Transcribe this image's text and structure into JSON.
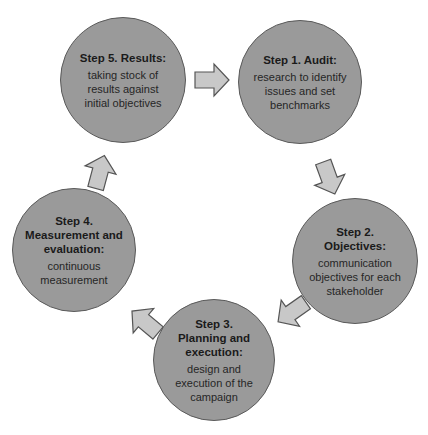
{
  "diagram": {
    "type": "cycle",
    "colors": {
      "circle_fill": "#9a9a9a",
      "circle_stroke": "#5a5a5a",
      "arrow_fill": "#c8c8c8",
      "arrow_stroke": "#555555"
    },
    "steps": [
      {
        "id": "step1",
        "title": "Step 1. Audit:",
        "description": "research to identify issues and set benchmarks"
      },
      {
        "id": "step2",
        "title": "Step 2. Objectives:",
        "description": "communication objectives for each stakeholder"
      },
      {
        "id": "step3",
        "title": "Step 3. Planning and execution:",
        "description": "design and execution of the campaign"
      },
      {
        "id": "step4",
        "title": "Step 4. Measurement and evaluation:",
        "description": "continuous measurement"
      },
      {
        "id": "step5",
        "title": "Step 5. Results:",
        "description": "taking stock of results against initial objectives"
      }
    ],
    "arrows": [
      {
        "from": "step5",
        "to": "step1",
        "icon": "arrow-right-icon"
      },
      {
        "from": "step1",
        "to": "step2",
        "icon": "arrow-down-right-icon"
      },
      {
        "from": "step2",
        "to": "step3",
        "icon": "arrow-down-left-icon"
      },
      {
        "from": "step3",
        "to": "step4",
        "icon": "arrow-up-left-icon"
      },
      {
        "from": "step4",
        "to": "step5",
        "icon": "arrow-up-icon"
      }
    ]
  }
}
